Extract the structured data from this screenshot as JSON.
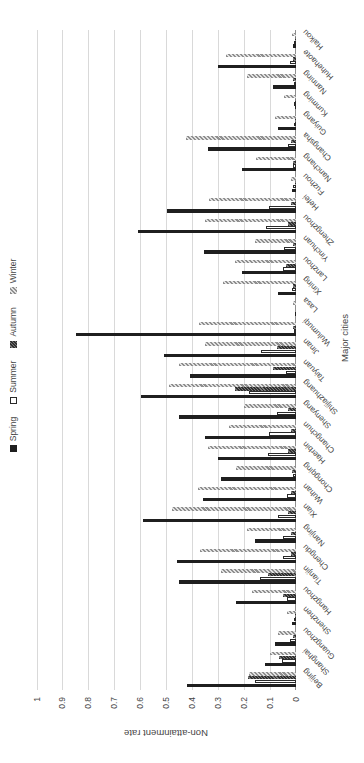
{
  "window": {
    "width": 364,
    "height": 763,
    "note": "column chart image rotated 90 degrees counter-clockwise"
  },
  "chart_data": {
    "type": "bar",
    "title": "",
    "xlabel": "Major cities",
    "ylabel": "Non-attainment rate",
    "ylim": [
      0,
      1
    ],
    "ytick_labels": [
      "0",
      "0.1",
      "0.2",
      "0.3",
      "0.4",
      "0.5",
      "0.6",
      "0.7",
      "0.8",
      "0.9",
      "1"
    ],
    "grid": "value gridlines every 0.1",
    "legend_position": "top",
    "categories": [
      "Beijing",
      "Shanghai",
      "Guangzhou",
      "Shenzhen",
      "Hangzhou",
      "Tianjin",
      "Chengdu",
      "Nanjing",
      "Xian",
      "Wuhan",
      "Chongqing",
      "Haerbin",
      "Changchun",
      "Shenyang",
      "Shijiazhuang",
      "Taiyuan",
      "Jinan",
      "Wulumuqi",
      "Lasa",
      "Xining",
      "Lanzhou",
      "Yinchuan",
      "Zhengzhou",
      "Hefei",
      "Fuzhou",
      "Nanchang",
      "Changsha",
      "Guiyang",
      "Kunming",
      "Nanning",
      "Huhehaote",
      "Haikou"
    ],
    "series": [
      {
        "name": "Spring",
        "style": "solid-black",
        "values": [
          0.42,
          0.12,
          0.08,
          0.015,
          0.23,
          0.45,
          0.46,
          0.16,
          0.59,
          0.36,
          0.29,
          0.3,
          0.35,
          0.45,
          0.6,
          0.41,
          0.51,
          0.85,
          0.005,
          0.07,
          0.21,
          0.355,
          0.61,
          0.5,
          0.015,
          0.21,
          0.34,
          0.07,
          0.005,
          0.09,
          0.3,
          0.01
        ]
      },
      {
        "name": "Summer",
        "style": "white-outlined",
        "values": [
          0.16,
          0.055,
          0.025,
          0.005,
          0.035,
          0.14,
          0.05,
          0.05,
          0.07,
          0.035,
          0.01,
          0.11,
          0.105,
          0.075,
          0.18,
          0.04,
          0.135,
          0.005,
          0,
          0.015,
          0.05,
          0.045,
          0.115,
          0.105,
          0.01,
          0.01,
          0.03,
          0.005,
          0.005,
          0.005,
          0.025,
          0.005
        ]
      },
      {
        "name": "Autumn",
        "style": "dark-hatch",
        "values": [
          0.185,
          0.065,
          0.01,
          0.005,
          0.05,
          0.11,
          0.02,
          0.02,
          0.03,
          0.02,
          0.015,
          0.03,
          0.02,
          0.03,
          0.235,
          0.09,
          0.075,
          0.01,
          0,
          0.01,
          0.04,
          0.01,
          0.03,
          0.02,
          0.005,
          0.01,
          0.02,
          0.005,
          0.005,
          0.01,
          0.01,
          0.005
        ]
      },
      {
        "name": "Winter",
        "style": "gray-hatch",
        "values": [
          0.18,
          0.1,
          0.07,
          0.035,
          0.17,
          0.29,
          0.37,
          0.19,
          0.48,
          0.38,
          0.23,
          0.34,
          0.26,
          0.2,
          0.49,
          0.45,
          0.35,
          0.375,
          0.01,
          0.28,
          0.235,
          0.16,
          0.35,
          0.335,
          0.02,
          0.155,
          0.425,
          0.08,
          0.045,
          0.19,
          0.27,
          0.015
        ]
      }
    ],
    "colors": {
      "spring_bar": "#1f1f1f",
      "summer_fill": "#ffffff",
      "summer_border": "#2a2a2a",
      "autumn_hatch_dark": "#303030",
      "autumn_hatch_light": "#787878",
      "winter_hatch_dark": "#8f8f8f",
      "winter_hatch_light": "#e2e2e2",
      "gridline": "#d9d9d9",
      "axis_line": "#8f8f8f",
      "text": "#454545"
    }
  }
}
